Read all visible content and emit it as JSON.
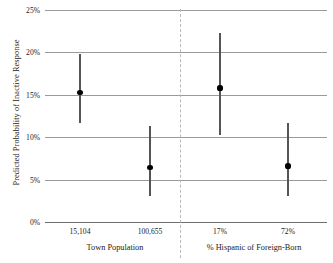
{
  "chart_data": {
    "type": "scatter",
    "title": "",
    "xlabel": "",
    "ylabel": "Predicted Probability of Inactive Response",
    "ylim": [
      0,
      25
    ],
    "ytick_labels": [
      "0%",
      "5%",
      "10%",
      "15%",
      "20%",
      "25%"
    ],
    "ytick_values": [
      0,
      5,
      10,
      15,
      20,
      25
    ],
    "grid": true,
    "legend": null,
    "error_bars": "vertical",
    "panels": [
      {
        "group_label": "Town Population",
        "points": [
          {
            "x_label": "15,104",
            "value": 15.3,
            "low": 11.7,
            "high": 19.8
          },
          {
            "x_label": "100,655",
            "value": 6.4,
            "low": 3.1,
            "high": 11.3
          }
        ]
      },
      {
        "group_label": "% Hispanic of Foreign-Born",
        "points": [
          {
            "x_label": "17%",
            "value": 15.8,
            "low": 10.2,
            "high": 22.3
          },
          {
            "x_label": "72%",
            "value": 6.6,
            "low": 3.1,
            "high": 11.7
          }
        ]
      }
    ]
  },
  "colors": {
    "marker": "#000000",
    "errorbar": "#555555",
    "gridline": "#9a9a9a",
    "baseline": "#6e6e6e",
    "divider": "#b9b9b9",
    "background": "#ffffff"
  }
}
